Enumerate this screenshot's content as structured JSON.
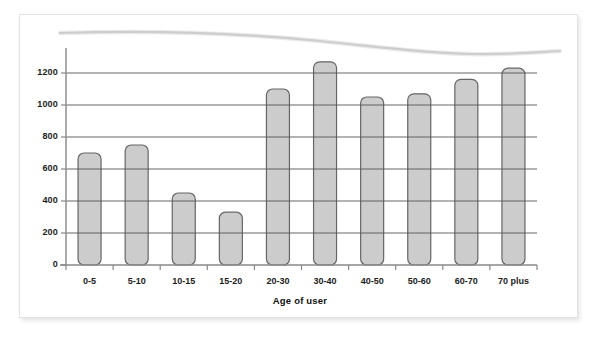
{
  "figure": {
    "background_color": "#ffffff",
    "frame_border_color": "#e2e2e2"
  },
  "chart_data": {
    "type": "bar",
    "title": "",
    "xlabel": "Age of user",
    "ylabel": "",
    "categories": [
      "0-5",
      "5-10",
      "10-15",
      "15-20",
      "20-30",
      "30-40",
      "40-50",
      "50-60",
      "60-70",
      "70 plus"
    ],
    "values": [
      700,
      750,
      450,
      330,
      1100,
      1270,
      1050,
      1070,
      1160,
      1230
    ],
    "ylim": [
      0,
      1300
    ],
    "yticks": [
      0,
      200,
      400,
      600,
      800,
      1000,
      1200
    ],
    "ytick_labels": [
      "0",
      "200",
      "400",
      "600",
      "800",
      "1000",
      "1200"
    ],
    "grid": true,
    "grid_axis": "y",
    "grid_color": "#555555",
    "legend": false,
    "bar_fill_color": "#cccccc",
    "bar_edge_color": "#666666",
    "axis_color": "#888888",
    "annotations": [
      {
        "name": "scan-artifact-curve",
        "description": "faint gray curved smudge arcing across top of page",
        "color": "#b5b5b5"
      }
    ]
  }
}
